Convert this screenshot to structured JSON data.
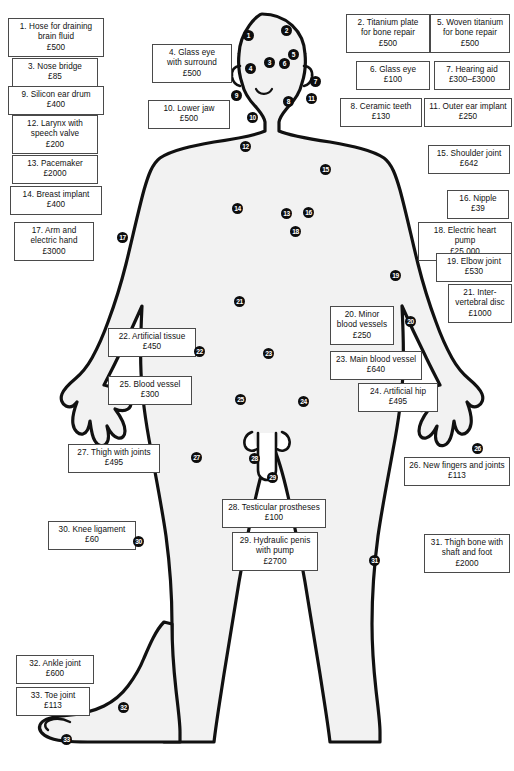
{
  "figure": {
    "currency_symbol": "£",
    "outline_color": "#111111",
    "body_fill": "#f2f2f2",
    "marker_color": "#0d0d0d",
    "marker_text_color": "#ffffff",
    "box_border_color": "#4a4a4a"
  },
  "callouts": [
    {
      "id": 1,
      "text": "1. Hose for draining\nbrain fluid\n£500",
      "x": 8,
      "y": 18,
      "w": 96,
      "h": 36
    },
    {
      "id": 3,
      "text": "3. Nose bridge\n£85",
      "x": 12,
      "y": 58,
      "w": 86,
      "h": 26
    },
    {
      "id": 9,
      "text": "9. Silicon ear drum\n£400",
      "x": 8,
      "y": 86,
      "w": 96,
      "h": 26
    },
    {
      "id": 12,
      "text": "12. Larynx with\nspeech valve\n£200",
      "x": 12,
      "y": 115,
      "w": 86,
      "h": 36
    },
    {
      "id": 13,
      "text": "13. Pacemaker\n£2000",
      "x": 12,
      "y": 155,
      "w": 86,
      "h": 26
    },
    {
      "id": 14,
      "text": "14. Breast implant\n£400",
      "x": 10,
      "y": 186,
      "w": 92,
      "h": 26
    },
    {
      "id": 17,
      "text": "17. Arm and\nelectric hand\n£3000",
      "x": 14,
      "y": 222,
      "w": 80,
      "h": 36
    },
    {
      "id": 4,
      "text": "4. Glass eye\nwith surround\n£500",
      "x": 152,
      "y": 44,
      "w": 80,
      "h": 36
    },
    {
      "id": 10,
      "text": "10. Lower jaw\n£500",
      "x": 148,
      "y": 100,
      "w": 82,
      "h": 26
    },
    {
      "id": 22,
      "text": "22. Artificial tissue\n£450",
      "x": 108,
      "y": 328,
      "w": 88,
      "h": 26
    },
    {
      "id": 25,
      "text": "25. Blood vessel\n£300",
      "x": 108,
      "y": 376,
      "w": 84,
      "h": 26
    },
    {
      "id": 27,
      "text": "27. Thigh with joints\n£495",
      "x": 68,
      "y": 444,
      "w": 92,
      "h": 26
    },
    {
      "id": 30,
      "text": "30. Knee ligament\n£60",
      "x": 48,
      "y": 521,
      "w": 88,
      "h": 26
    },
    {
      "id": 32,
      "text": "32. Ankle joint\n£600",
      "x": 16,
      "y": 655,
      "w": 78,
      "h": 26
    },
    {
      "id": 33,
      "text": "33. Toe joint\n£113",
      "x": 16,
      "y": 687,
      "w": 74,
      "h": 26
    },
    {
      "id": 28,
      "text": "28. Testicular prostheses\n£100",
      "x": 222,
      "y": 499,
      "w": 104,
      "h": 26
    },
    {
      "id": 29,
      "text": "29. Hydraulic penis\nwith pump\n£2700",
      "x": 232,
      "y": 532,
      "w": 86,
      "h": 36
    },
    {
      "id": 2,
      "text": "2. Titanium plate\nfor bone repair\n£500",
      "x": 346,
      "y": 14,
      "w": 84,
      "h": 36
    },
    {
      "id": 5,
      "text": "5. Woven titanium\nfor bone repair\n£500",
      "x": 430,
      "y": 14,
      "w": 80,
      "h": 36
    },
    {
      "id": 6,
      "text": "6. Glass eye\n£100",
      "x": 356,
      "y": 61,
      "w": 74,
      "h": 26
    },
    {
      "id": 7,
      "text": "7. Hearing aid\n£300–£3000",
      "x": 434,
      "y": 61,
      "w": 76,
      "h": 26
    },
    {
      "id": 8,
      "text": "8. Ceramic teeth\n£130",
      "x": 340,
      "y": 98,
      "w": 82,
      "h": 26
    },
    {
      "id": 11,
      "text": "11. Outer ear implant\n£250",
      "x": 424,
      "y": 98,
      "w": 88,
      "h": 26
    },
    {
      "id": 15,
      "text": "15. Shoulder joint\n£642",
      "x": 428,
      "y": 145,
      "w": 82,
      "h": 26
    },
    {
      "id": 16,
      "text": "16. Nipple\n£39",
      "x": 447,
      "y": 190,
      "w": 62,
      "h": 26
    },
    {
      "id": 18,
      "text": "18. Electric heart pump\n£25 000",
      "x": 418,
      "y": 222,
      "w": 94,
      "h": 26
    },
    {
      "id": 19,
      "text": "19. Elbow joint\n£530",
      "x": 436,
      "y": 253,
      "w": 76,
      "h": 26
    },
    {
      "id": 21,
      "text": "21. Inter-\nvertebral disc\n£1000",
      "x": 448,
      "y": 284,
      "w": 64,
      "h": 36
    },
    {
      "id": 20,
      "text": "20. Minor\nblood vessels\n£250",
      "x": 330,
      "y": 306,
      "w": 64,
      "h": 36
    },
    {
      "id": 23,
      "text": "23. Main blood vessel\n£640",
      "x": 330,
      "y": 351,
      "w": 92,
      "h": 26
    },
    {
      "id": 24,
      "text": "24. Artificial hip\n£495",
      "x": 358,
      "y": 383,
      "w": 80,
      "h": 26
    },
    {
      "id": 26,
      "text": "26. New fingers and joints\n£113",
      "x": 404,
      "y": 457,
      "w": 106,
      "h": 26
    },
    {
      "id": 31,
      "text": "31. Thigh bone with\nshaft and foot\n£2000",
      "x": 424,
      "y": 534,
      "w": 86,
      "h": 36
    }
  ],
  "markers": [
    {
      "n": 1,
      "x": 243,
      "y": 30,
      "size": "sm"
    },
    {
      "n": 2,
      "x": 281,
      "y": 25,
      "size": "sm"
    },
    {
      "n": 3,
      "x": 264,
      "y": 57,
      "size": "sm"
    },
    {
      "n": 4,
      "x": 245,
      "y": 63,
      "size": "sm"
    },
    {
      "n": 5,
      "x": 288,
      "y": 49,
      "size": "sm"
    },
    {
      "n": 6,
      "x": 279,
      "y": 58,
      "size": "sm"
    },
    {
      "n": 7,
      "x": 310,
      "y": 76,
      "size": "sm"
    },
    {
      "n": 8,
      "x": 283,
      "y": 96,
      "size": "sm"
    },
    {
      "n": 9,
      "x": 231,
      "y": 90,
      "size": "sm"
    },
    {
      "n": 10,
      "x": 247,
      "y": 112,
      "size": "sm"
    },
    {
      "n": 11,
      "x": 306,
      "y": 93,
      "size": "sm"
    },
    {
      "n": 12,
      "x": 240,
      "y": 141,
      "size": "sm"
    },
    {
      "n": 13,
      "x": 281,
      "y": 208,
      "size": "sm"
    },
    {
      "n": 14,
      "x": 232,
      "y": 203,
      "size": "sm"
    },
    {
      "n": 15,
      "x": 320,
      "y": 164,
      "size": "sm"
    },
    {
      "n": 16,
      "x": 303,
      "y": 207,
      "size": "sm"
    },
    {
      "n": 17,
      "x": 117,
      "y": 232,
      "size": "sm"
    },
    {
      "n": 18,
      "x": 290,
      "y": 226,
      "size": "sm"
    },
    {
      "n": 19,
      "x": 390,
      "y": 270,
      "size": "sm"
    },
    {
      "n": 20,
      "x": 405,
      "y": 316,
      "size": "sm"
    },
    {
      "n": 21,
      "x": 234,
      "y": 296,
      "size": "sm"
    },
    {
      "n": 22,
      "x": 194,
      "y": 346,
      "size": "sm"
    },
    {
      "n": 23,
      "x": 263,
      "y": 348,
      "size": "sm"
    },
    {
      "n": 24,
      "x": 298,
      "y": 396,
      "size": "sm"
    },
    {
      "n": 25,
      "x": 235,
      "y": 394,
      "size": "sm"
    },
    {
      "n": 26,
      "x": 472,
      "y": 443,
      "size": "sm"
    },
    {
      "n": 27,
      "x": 191,
      "y": 452,
      "size": "sm"
    },
    {
      "n": 28,
      "x": 249,
      "y": 453,
      "size": "sm"
    },
    {
      "n": 29,
      "x": 267,
      "y": 472,
      "size": "sm"
    },
    {
      "n": 30,
      "x": 133,
      "y": 536,
      "size": "sm"
    },
    {
      "n": 31,
      "x": 369,
      "y": 555,
      "size": "sm"
    },
    {
      "n": 32,
      "x": 118,
      "y": 702,
      "size": "sm"
    },
    {
      "n": 33,
      "x": 61,
      "y": 734,
      "size": "sm"
    }
  ]
}
